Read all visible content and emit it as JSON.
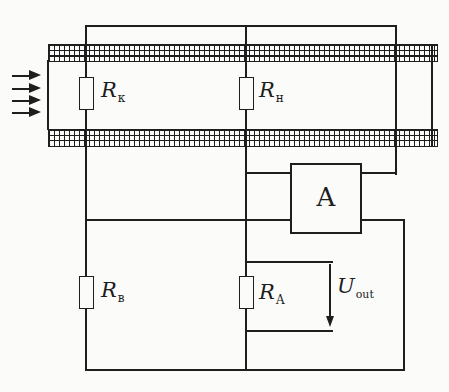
{
  "colors": {
    "ink": "#1e1e1e",
    "paper": "#fbfbf9"
  },
  "duct": {
    "flow_arrow_count": 4
  },
  "components": {
    "r_k": {
      "base": "R",
      "sub": "к"
    },
    "r_h": {
      "base": "R",
      "sub": "н"
    },
    "r_b": {
      "base": "R",
      "sub": "в"
    },
    "r_a": {
      "base": "R",
      "sub": "А"
    },
    "amplifier": {
      "label": "A"
    },
    "u_out": {
      "base": "U",
      "sub": "out"
    }
  }
}
